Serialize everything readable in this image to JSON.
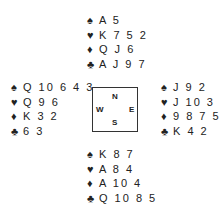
{
  "hands": {
    "north": {
      "spades": "A 5",
      "hearts": "K 7 5 2",
      "diamonds": "Q J 6",
      "clubs": "A J 9 7"
    },
    "west": {
      "spades": "Q 10 6 4 3",
      "hearts": "Q 9 6",
      "diamonds": "K 3 2",
      "clubs": "6 3"
    },
    "east": {
      "spades": "J 9 2",
      "hearts": "J 10 3",
      "diamonds": "9 8 7 5",
      "clubs": "K 4 2"
    },
    "south": {
      "spades": "K 8 7",
      "hearts": "A 8 4",
      "diamonds": "A 10 4",
      "clubs": "Q 10 8 5"
    }
  },
  "suits": {
    "spades": "♠",
    "hearts": "♥",
    "diamonds": "♦",
    "clubs": "♣"
  },
  "compass": {
    "n": "N",
    "w": "W",
    "e": "E",
    "s": "S"
  }
}
